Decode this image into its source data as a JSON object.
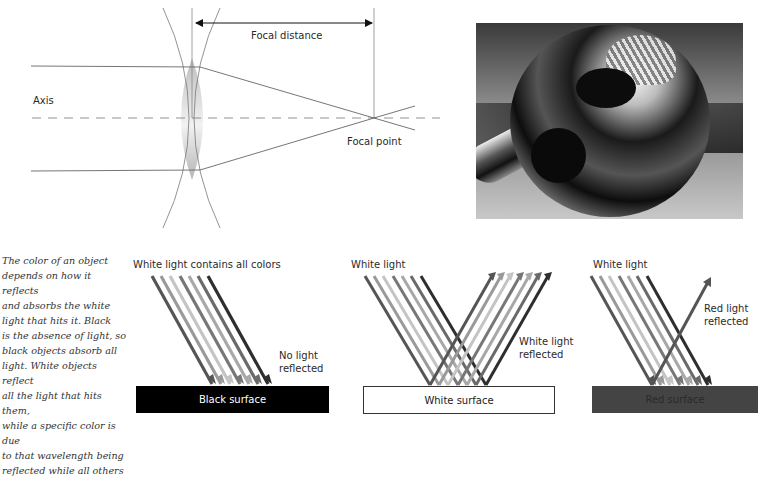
{
  "lens_diagram": {
    "focal_distance_label": "Focal distance",
    "axis_label": "Axis",
    "focal_point_label": "Focal point"
  },
  "photo": {
    "description": "Black and white photo of a reflective chrome sphere reflecting a building and a person"
  },
  "caption": {
    "lines": [
      "The color of an object",
      "depends on how it reflects",
      "and absorbs the white",
      "light that hits it. Black",
      "is the absence of light, so",
      "black objects absorb all",
      "light. White objects reflect",
      "all the light that hits them,",
      "while a specific color is due",
      "to that wavelength being",
      "reflected while all others"
    ]
  },
  "panels": [
    {
      "title": "White light contains all colors",
      "note_line1": "No light",
      "note_line2": "reflected",
      "surface_label": "Black surface",
      "surface_color": "#000000",
      "surface_text_color": "#ffffff"
    },
    {
      "title": "White light",
      "note_line1": "White light",
      "note_line2": "reflected",
      "surface_label": "White surface",
      "surface_color": "#ffffff",
      "surface_text_color": "#222222"
    },
    {
      "title": "White light",
      "note_line1": "Red light",
      "note_line2": "reflected",
      "surface_label": "Red surface",
      "surface_color": "#444444",
      "surface_text_color": "#2a2a2a"
    }
  ],
  "ray_colors": [
    "#555555",
    "#9a9a9a",
    "#c4c4c4",
    "#777777",
    "#a8a8a8",
    "#6a6a6a",
    "#2e2e2e"
  ]
}
